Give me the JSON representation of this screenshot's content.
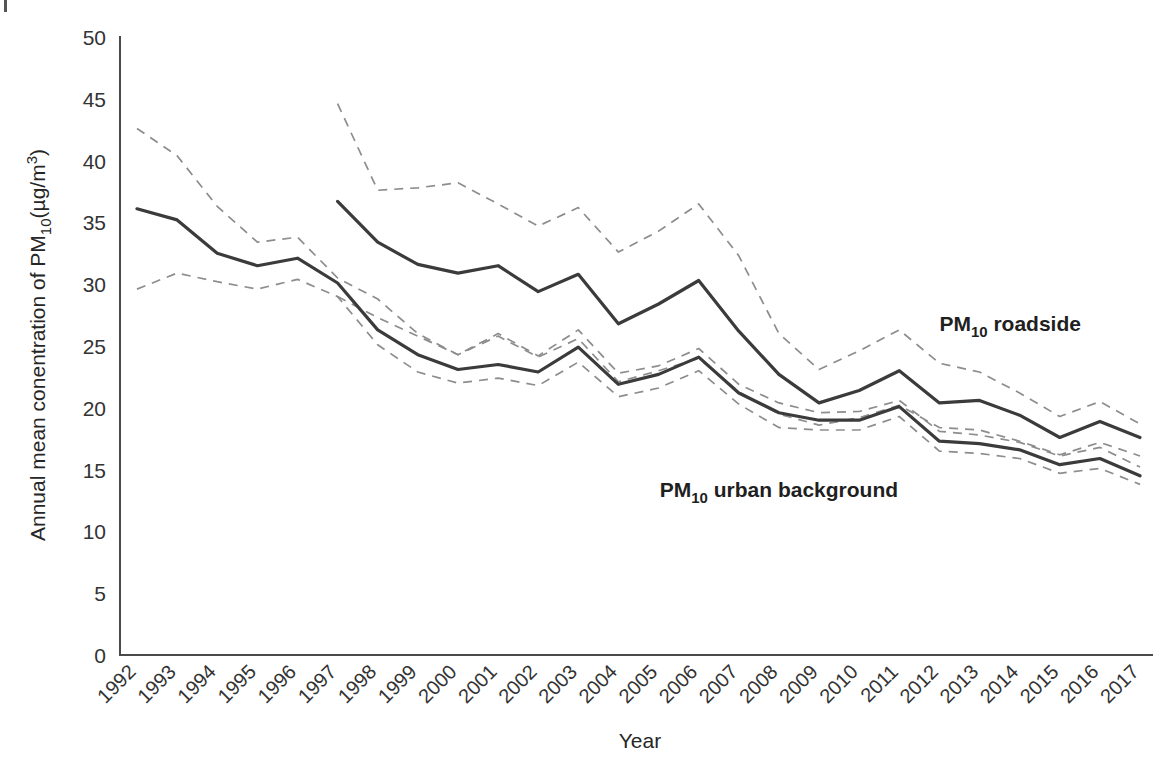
{
  "figure": {
    "corner_mark": "crop-mark",
    "background_color": "#ffffff",
    "solid_line_color": "#3b3b3b",
    "dashed_line_color": "#8d8d8d"
  },
  "chart_data": {
    "type": "line",
    "title": "",
    "xlabel": "Year",
    "ylabel": "Annual mean conentration of PM10(µg/m3)",
    "ylabel_parts": {
      "prefix": "Annual mean conentration of PM",
      "subscript": "10",
      "middle": "(µg/m",
      "superscript": "3",
      "suffix": ")"
    },
    "grid": false,
    "legend_position": "inline-annotation",
    "ylim": [
      0,
      50
    ],
    "yticks": [
      0,
      5,
      10,
      15,
      20,
      25,
      30,
      35,
      40,
      45,
      50
    ],
    "ytick_labels": [
      "0",
      "5",
      "10",
      "15",
      "20",
      "25",
      "30",
      "35",
      "40",
      "45",
      "50"
    ],
    "categories": [
      "1992",
      "1993",
      "1994",
      "1995",
      "1996",
      "1997",
      "1998",
      "1999",
      "2000",
      "2001",
      "2002",
      "2003",
      "2004",
      "2005",
      "2006",
      "2007",
      "2008",
      "2009",
      "2010",
      "2011",
      "2012",
      "2013",
      "2014",
      "2015",
      "2016",
      "2017"
    ],
    "x": [
      1992,
      1993,
      1994,
      1995,
      1996,
      1997,
      1998,
      1999,
      2000,
      2001,
      2002,
      2003,
      2004,
      2005,
      2006,
      2007,
      2008,
      2009,
      2010,
      2011,
      2012,
      2013,
      2014,
      2015,
      2016,
      2017
    ],
    "series": [
      {
        "name": "PM10 roadside",
        "label": "PM10 roadside",
        "label_parts": {
          "prefix": "PM",
          "subscript": "10",
          "suffix": " roadside"
        },
        "style": "solid",
        "color": "#3b3b3b",
        "start_year": 1997,
        "values": [
          null,
          null,
          null,
          null,
          null,
          36.7,
          33.4,
          31.6,
          30.9,
          31.5,
          29.4,
          30.8,
          26.8,
          28.4,
          30.3,
          26.2,
          22.7,
          20.4,
          21.4,
          23.0,
          20.4,
          20.6,
          19.4,
          17.6,
          18.9,
          17.6
        ],
        "upper_band": [
          null,
          null,
          null,
          null,
          null,
          44.6,
          37.6,
          37.8,
          38.2,
          36.5,
          34.7,
          36.2,
          32.6,
          34.3,
          36.5,
          32.3,
          26.0,
          23.1,
          24.6,
          26.3,
          23.6,
          22.9,
          21.2,
          19.3,
          20.5,
          18.7
        ],
        "lower_band": [
          null,
          null,
          null,
          null,
          null,
          29.0,
          27.3,
          25.8,
          24.3,
          25.8,
          24.1,
          25.6,
          22.1,
          23.0,
          24.0,
          21.3,
          19.5,
          18.6,
          19.2,
          20.2,
          18.4,
          18.2,
          17.3,
          16.2,
          17.2,
          16.1
        ]
      },
      {
        "name": "PM10 urban background",
        "label": "PM10 urban background",
        "label_parts": {
          "prefix": "PM",
          "subscript": "10",
          "suffix": " urban background"
        },
        "style": "solid",
        "color": "#3b3b3b",
        "start_year": 1992,
        "values": [
          36.1,
          35.2,
          32.5,
          31.5,
          32.1,
          30.1,
          26.3,
          24.3,
          23.1,
          23.5,
          22.9,
          24.9,
          21.9,
          22.7,
          24.1,
          21.2,
          19.6,
          19.0,
          19.0,
          20.1,
          17.3,
          17.1,
          16.6,
          15.4,
          15.9,
          14.5
        ],
        "upper_band": [
          42.6,
          40.4,
          36.3,
          33.4,
          33.8,
          30.5,
          28.8,
          26.0,
          24.3,
          26.0,
          24.2,
          26.3,
          22.8,
          23.4,
          24.8,
          21.9,
          20.4,
          19.6,
          19.7,
          20.6,
          18.1,
          17.8,
          17.2,
          16.1,
          16.8,
          15.2
        ],
        "lower_band": [
          29.6,
          30.9,
          30.2,
          29.6,
          30.4,
          29.0,
          25.1,
          22.9,
          22.0,
          22.4,
          21.8,
          23.7,
          20.9,
          21.6,
          23.0,
          20.3,
          18.4,
          18.2,
          18.2,
          19.3,
          16.5,
          16.3,
          15.9,
          14.7,
          15.1,
          13.8
        ]
      }
    ],
    "annotations": [
      {
        "text": "PM10 roadside",
        "x_year": 2012,
        "y_value": 26.2
      },
      {
        "text": "PM10 urban background",
        "x_year": 2008,
        "y_value": 12.8
      }
    ]
  }
}
